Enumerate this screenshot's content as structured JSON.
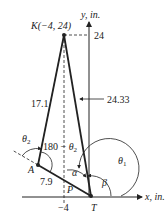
{
  "diagram": {
    "points": {
      "K": {
        "label": "K(−4, 24)"
      },
      "A": {
        "label": "A"
      },
      "P": {
        "label": "P"
      },
      "T": {
        "label": "T"
      }
    },
    "axes": {
      "x_label": "x, in.",
      "y_label": "y, in.",
      "y_tick": "24",
      "x_tick": "−4"
    },
    "lengths": {
      "KA": "17.1",
      "AT": "7.9",
      "KT_height": "24.33"
    },
    "angles": {
      "theta1": "θ",
      "theta1_sub": "1",
      "theta2": "θ",
      "theta2_sub": "2",
      "inner_prefix": "180 − ",
      "inner_theta": "θ",
      "inner_sub": "2",
      "alpha": "α",
      "beta": "β"
    }
  }
}
